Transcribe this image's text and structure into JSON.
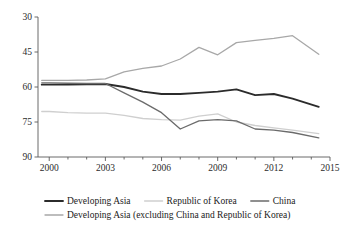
{
  "chart_data": {
    "type": "line",
    "title": "",
    "xlabel": "",
    "ylabel": "",
    "xlim": [
      1999.4,
      2015.0
    ],
    "ylim": [
      30,
      90
    ],
    "yticks": [
      30,
      45,
      60,
      75,
      90
    ],
    "xticks": [
      2000,
      2003,
      2006,
      2009,
      2012,
      2015
    ],
    "xticks_minor": [
      2001,
      2002,
      2004,
      2005,
      2007,
      2008,
      2010,
      2011,
      2013,
      2014
    ],
    "grid": false,
    "legend_position": "bottom",
    "x": [
      1999.6,
      2000,
      2001,
      2002,
      2003,
      2004,
      2005,
      2006,
      2007,
      2008,
      2009,
      2010,
      2011,
      2012,
      2013,
      2014.4
    ],
    "series": [
      {
        "name": "Developing Asia",
        "color": "#2b2b2b",
        "width": 1.9,
        "values": [
          61.0,
          61.0,
          61.0,
          61.2,
          61.3,
          60.0,
          58.0,
          57.0,
          57.0,
          57.5,
          58.0,
          59.0,
          56.5,
          57.0,
          55.0,
          51.5
        ]
      },
      {
        "name": "Republic of Korea",
        "color": "#cfcfcf",
        "width": 1.3,
        "values": [
          49.5,
          49.5,
          49.0,
          48.8,
          48.8,
          47.8,
          46.5,
          46.0,
          45.8,
          47.5,
          48.5,
          45.0,
          43.5,
          42.5,
          41.5,
          40.0
        ]
      },
      {
        "name": "China",
        "color": "#6b6b6b",
        "width": 1.3,
        "values": [
          61.8,
          61.8,
          61.6,
          61.5,
          61.5,
          57.5,
          53.5,
          49.0,
          42.0,
          45.5,
          46.0,
          45.5,
          42.0,
          41.5,
          40.5,
          38.2
        ]
      },
      {
        "name": "Developing Asia (excluding China and Republic of Korea)",
        "color": "#a8a8a8",
        "width": 1.3,
        "values": [
          62.8,
          62.8,
          62.8,
          63.0,
          63.5,
          66.5,
          68.0,
          69.0,
          72.0,
          77.0,
          73.8,
          79.0,
          80.0,
          80.8,
          82.0,
          74.0
        ]
      }
    ]
  },
  "legend": {
    "row1": [
      {
        "label": "Developing Asia"
      },
      {
        "label": "Republic of Korea"
      },
      {
        "label": "China"
      }
    ],
    "row2": [
      {
        "label": "Developing Asia (excluding China and Republic of Korea)"
      }
    ]
  },
  "axis": {
    "ytick_labels": [
      "90",
      "75",
      "60",
      "45",
      "30"
    ],
    "xtick_labels": [
      "2000",
      "2003",
      "2006",
      "2009",
      "2012",
      "2015"
    ]
  }
}
